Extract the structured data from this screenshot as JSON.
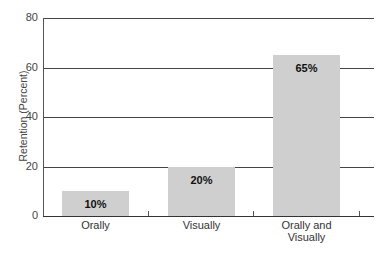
{
  "chart_data": {
    "type": "bar",
    "title": "",
    "xlabel": "",
    "ylabel": "Retention (Percent)",
    "ylim": [
      0,
      80
    ],
    "yticks": [
      0,
      20,
      40,
      60,
      80
    ],
    "grid": true,
    "categories": [
      "Orally",
      "Visually",
      "Orally and Visually"
    ],
    "category_lines": [
      [
        "Orally"
      ],
      [
        "Visually"
      ],
      [
        "Orally and",
        "Visually"
      ]
    ],
    "values": [
      10,
      20,
      65
    ],
    "data_labels": [
      "10%",
      "20%",
      "65%"
    ],
    "bar_color": "#cfcfcf"
  }
}
